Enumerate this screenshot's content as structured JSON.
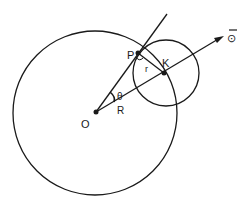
{
  "diagram": {
    "labels": {
      "origin": "O",
      "point_p": "P",
      "point_k": "K",
      "small_radius": "r",
      "large_radius": "R",
      "angle": "θ",
      "direction": "⊙"
    },
    "colors": {
      "stroke": "#1a1a1a",
      "background": "#ffffff"
    }
  }
}
